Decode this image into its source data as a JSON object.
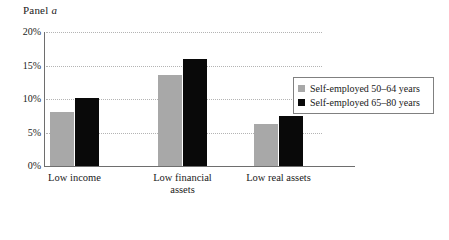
{
  "panel": {
    "title_prefix": "Panel ",
    "title_italic": "a"
  },
  "chart_data": {
    "type": "bar",
    "title": "Panel a",
    "xlabel": "",
    "ylabel": "",
    "ylim": [
      0,
      20
    ],
    "ytick_labels": [
      "0%",
      "5%",
      "10%",
      "15%",
      "20%"
    ],
    "ytick_values": [
      0,
      5,
      10,
      15,
      20
    ],
    "grid": true,
    "grid_axis": "y",
    "grid_style": "dotted",
    "legend_position": "right",
    "categories": [
      "Low income",
      "Low financial\nassets",
      "Low real assets"
    ],
    "series": [
      {
        "name": "Self-employed 50–64 years",
        "color": "#a8a8a8",
        "values": [
          8.1,
          13.6,
          6.3
        ]
      },
      {
        "name": "Self-employed 65–80 years",
        "color": "#090909",
        "values": [
          10.2,
          15.9,
          7.4
        ]
      }
    ]
  },
  "legend": {
    "items": [
      {
        "label": "Self-employed 50–64 years",
        "swatch": "#a8a8a8"
      },
      {
        "label": "Self-employed 65–80 years",
        "swatch": "#090909"
      }
    ]
  }
}
